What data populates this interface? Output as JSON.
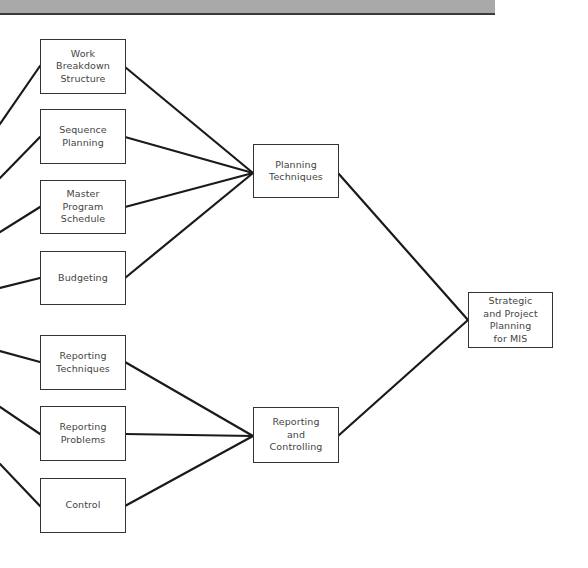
{
  "diagram": {
    "type": "hierarchy-tree",
    "root": {
      "id": "strategic",
      "label": "Strategic\nand Project\nPlanning\nfor MIS"
    },
    "groups": [
      {
        "id": "planning",
        "label": "Planning\nTechniques",
        "children": [
          {
            "id": "wbs",
            "label": "Work\nBreakdown\nStructure"
          },
          {
            "id": "seq",
            "label": "Sequence\nPlanning"
          },
          {
            "id": "mps",
            "label": "Master\nProgram\nSchedule"
          },
          {
            "id": "budget",
            "label": "Budgeting"
          }
        ]
      },
      {
        "id": "reporting",
        "label": "Reporting\nand\nControlling",
        "children": [
          {
            "id": "rtech",
            "label": "Reporting\nTechniques"
          },
          {
            "id": "rprob",
            "label": "Reporting\nProblems"
          },
          {
            "id": "control",
            "label": "Control"
          }
        ]
      }
    ],
    "colors": {
      "line": "#1a1a1a",
      "box_border": "#333333",
      "text": "#444444",
      "header_band": "#a9a9a9"
    }
  }
}
